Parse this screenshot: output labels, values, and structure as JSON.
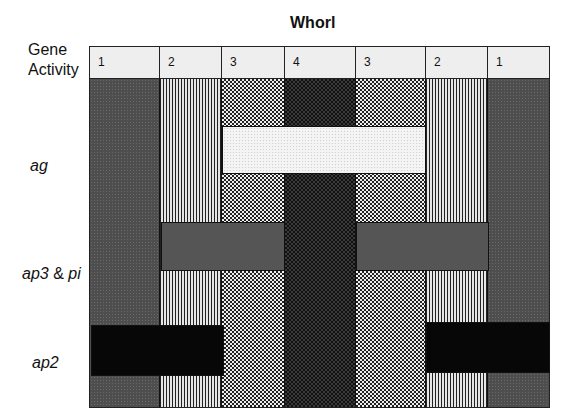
{
  "title": "Whorl",
  "row_header": {
    "line1": "Gene",
    "line2": "Activity"
  },
  "rows": [
    {
      "label": "ag"
    },
    {
      "label_part1": "ap3",
      "label_amp": "&",
      "label_part2": "pi"
    },
    {
      "label": "ap2"
    }
  ],
  "whorls": [
    "1",
    "2",
    "3",
    "4",
    "3",
    "2",
    "1"
  ],
  "column_patterns": [
    "dark-stipple",
    "vertical-lines",
    "checker",
    "dark-checker",
    "checker",
    "vertical-lines",
    "dark-stipple"
  ],
  "gene_bands": [
    {
      "gene": "ag",
      "whorls_spanned": "3-4-3",
      "fill": "light-stipple"
    },
    {
      "gene": "ap3 & pi",
      "whorls_spanned": "2-3 (left), 3-2 (right)",
      "fill": "medium-gray"
    },
    {
      "gene": "ap2",
      "whorls_spanned": "1-2 (left), 2-1 (right)",
      "fill": "black"
    }
  ]
}
